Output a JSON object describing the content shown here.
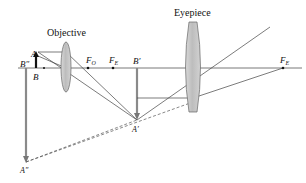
{
  "colors": {
    "ray": "#444444",
    "axis": "#555555",
    "lens_fill": "#c9c9c9",
    "lens_stroke": "#666666",
    "image_arrow": "#8a8a8a",
    "object_arrow": "#111111"
  },
  "labels": {
    "objective": "Objective",
    "eyepiece": "Eyepiece",
    "A": "A",
    "B": "B",
    "A_prime": "A′",
    "B_prime": "B′",
    "A_double_prime": "A″",
    "B_double_prime": "B″",
    "F": "F",
    "sub_O": "O",
    "sub_E": "E"
  }
}
